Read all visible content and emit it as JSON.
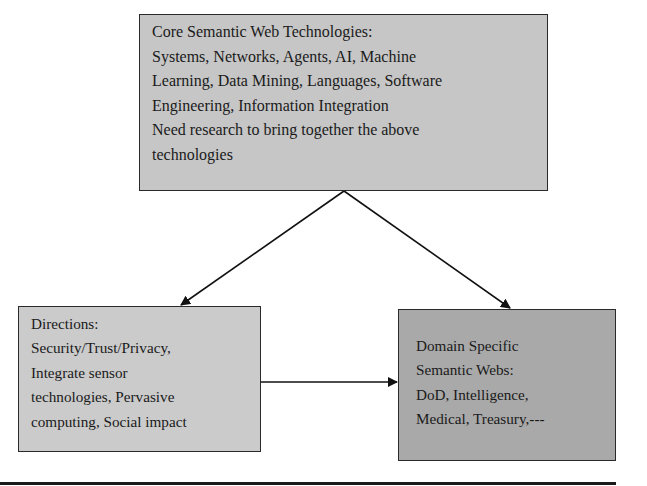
{
  "diagram": {
    "nodes": {
      "core": {
        "title": "Core Semantic Web Technologies:",
        "lines": [
          "Systems, Networks, Agents, AI, Machine",
          "Learning, Data Mining, Languages, Software",
          "Engineering, Information Integration",
          "Need research to bring together the above",
          "technologies"
        ],
        "fill": "#c6c6c6"
      },
      "directions": {
        "title": "Directions:",
        "lines": [
          "Security/Trust/Privacy,",
          "Integrate sensor",
          "technologies, Pervasive",
          "computing, Social impact"
        ],
        "fill": "#cbcbcb"
      },
      "domain": {
        "title_lines": [
          "Domain Specific",
          "Semantic Webs:"
        ],
        "lines": [
          "DoD, Intelligence,",
          "Medical, Treasury,---"
        ],
        "fill": "#a9a9a9"
      }
    },
    "edges": [
      {
        "from": "core",
        "to": "directions"
      },
      {
        "from": "core",
        "to": "domain"
      },
      {
        "from": "directions",
        "to": "domain"
      }
    ]
  }
}
